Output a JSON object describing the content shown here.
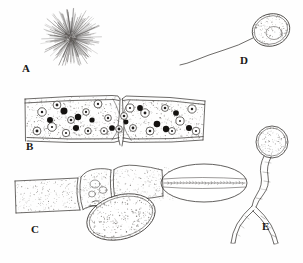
{
  "figure": {
    "background_color": "#fefefe",
    "ink_color": "#2e2b28",
    "width": 303,
    "height": 263,
    "panel_labels": [
      "A",
      "B",
      "C",
      "D",
      "E"
    ]
  },
  "panels": [
    {
      "id": "A",
      "label": "A",
      "label_x": 22,
      "label_y": 72,
      "subject": "radiating spore ball with filaments",
      "center_x": 71,
      "center_y": 38,
      "core_radius": 7,
      "ray_count": 150,
      "ray_length_min": 16,
      "ray_length_max": 31
    },
    {
      "id": "B",
      "label": "B",
      "label_x": 26,
      "label_y": 150,
      "subject": "host tissue cross-section with infected cells",
      "left": 25,
      "top": 98,
      "width": 180,
      "height": 44,
      "dark_nuclei_count": 10,
      "ringed_cells_count": 16
    },
    {
      "id": "C",
      "label": "C",
      "label_x": 31,
      "label_y": 233,
      "subject": "hyphal segments bearing sporangia",
      "left": 14,
      "top": 168,
      "width": 230,
      "height": 78
    },
    {
      "id": "D",
      "label": "D",
      "label_x": 240,
      "label_y": 64,
      "subject": "flagellated zoospore",
      "body_cx": 271,
      "body_cy": 30,
      "body_rx": 19,
      "body_ry": 16,
      "flagellum_length": 68
    },
    {
      "id": "E",
      "label": "E",
      "label_x": 262,
      "label_y": 230,
      "subject": "encysted spore with branching germ tube",
      "cyst_cx": 272,
      "cyst_cy": 142,
      "cyst_rx": 16,
      "cyst_ry": 15,
      "branch_point_x": 253,
      "branch_point_y": 207
    }
  ]
}
